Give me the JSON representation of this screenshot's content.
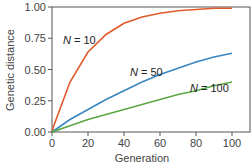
{
  "chart_data": {
    "type": "line",
    "title": "",
    "xlabel": "Generation",
    "ylabel": "Genetic distance",
    "xlim": [
      0,
      100
    ],
    "ylim": [
      0,
      1
    ],
    "xticks": [
      "0",
      "20",
      "40",
      "60",
      "80",
      "100"
    ],
    "yticks": [
      "0.00",
      "0.25",
      "0.50",
      "0.75",
      "1.00"
    ],
    "grid": false,
    "legend": "inline annotations",
    "x": [
      1,
      10,
      20,
      30,
      40,
      50,
      60,
      70,
      80,
      90,
      100
    ],
    "series": [
      {
        "name": "N = 10",
        "color": "#e05a2b",
        "values": [
          0.05,
          0.4,
          0.64,
          0.78,
          0.87,
          0.92,
          0.95,
          0.97,
          0.98,
          0.99,
          0.99
        ]
      },
      {
        "name": "N = 50",
        "color": "#3a86c0",
        "values": [
          0.01,
          0.1,
          0.18,
          0.26,
          0.33,
          0.4,
          0.46,
          0.51,
          0.56,
          0.6,
          0.63
        ]
      },
      {
        "name": "N = 100",
        "color": "#5aa843",
        "values": [
          0.005,
          0.05,
          0.1,
          0.14,
          0.18,
          0.22,
          0.26,
          0.3,
          0.33,
          0.37,
          0.4
        ]
      }
    ],
    "annotations": [
      {
        "text": "N = 10",
        "x": 10,
        "y": 0.75
      },
      {
        "text": "N = 50",
        "x": 50,
        "y": 0.48
      },
      {
        "text": "N = 100",
        "x": 90,
        "y": 0.38
      }
    ]
  }
}
